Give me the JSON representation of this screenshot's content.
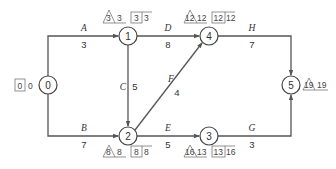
{
  "diagram": {
    "type": "activity-on-arrow network",
    "nodes": [
      {
        "id": "0",
        "label": "0",
        "x": 48,
        "y": 85
      },
      {
        "id": "1",
        "label": "1",
        "x": 128,
        "y": 36
      },
      {
        "id": "2",
        "label": "2",
        "x": 128,
        "y": 136
      },
      {
        "id": "3",
        "label": "3",
        "x": 209,
        "y": 136
      },
      {
        "id": "4",
        "label": "4",
        "x": 209,
        "y": 36
      },
      {
        "id": "5",
        "label": "5",
        "x": 291,
        "y": 85
      }
    ],
    "activities": [
      {
        "name": "A",
        "duration": "3",
        "from": "0",
        "to": "1"
      },
      {
        "name": "B",
        "duration": "7",
        "from": "0",
        "to": "2"
      },
      {
        "name": "C",
        "duration": "5",
        "from": "1",
        "to": "2"
      },
      {
        "name": "D",
        "duration": "8",
        "from": "1",
        "to": "4"
      },
      {
        "name": "E",
        "duration": "5",
        "from": "2",
        "to": "3"
      },
      {
        "name": "F",
        "duration": "4",
        "from": "2",
        "to": "4"
      },
      {
        "name": "G",
        "duration": "3",
        "from": "3",
        "to": "5"
      },
      {
        "name": "H",
        "duration": "7",
        "from": "4",
        "to": "5"
      }
    ],
    "node_times": {
      "0": {
        "box": [
          "0",
          "0"
        ]
      },
      "1": {
        "triangle": "3",
        "after_triangle": "3",
        "box": [
          "3",
          "3"
        ]
      },
      "2": {
        "triangle": "8",
        "after_triangle": "8",
        "box": [
          "8",
          "8"
        ]
      },
      "3": {
        "triangle": "16",
        "after_triangle": "13",
        "box": [
          "13",
          "16"
        ]
      },
      "4": {
        "triangle": "12",
        "after_triangle": "12",
        "box": [
          "12",
          "12"
        ]
      },
      "5": {
        "triangle": "19",
        "after_triangle": "19"
      }
    }
  }
}
